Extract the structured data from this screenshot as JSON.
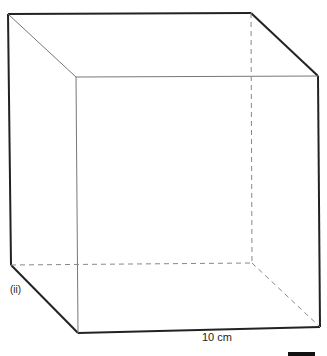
{
  "figure": {
    "part_label": "(ii)",
    "dimension_label": "10 cm",
    "shape": "cube",
    "colors": {
      "edge": "#222222",
      "thin_edge": "#777777",
      "hidden_edge": "#888888"
    },
    "vertices": {
      "back_top_left": [
        8,
        14
      ],
      "back_top_right": [
        251,
        13
      ],
      "back_bottom_left": [
        11,
        265
      ],
      "back_bottom_right_hidden": [
        252,
        263
      ],
      "front_top_left": [
        76,
        77
      ],
      "front_top_right": [
        318,
        76
      ],
      "front_bottom_left": [
        78,
        333
      ],
      "front_bottom_right": [
        320,
        327
      ]
    }
  }
}
